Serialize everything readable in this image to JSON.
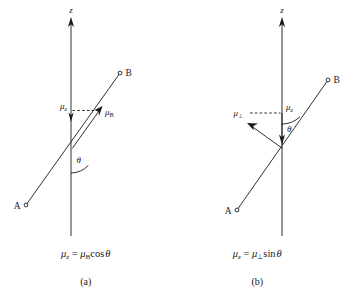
{
  "figure": {
    "background_color": "#ffffff",
    "line_color": "#1a1a1a",
    "panels": [
      {
        "id": "a",
        "caption_letter": "(a)",
        "axis_label": "z",
        "point_a_label": "A",
        "point_b_label": "B",
        "angle_label": "θ",
        "mu_z_label": "μ",
        "mu_z_subscript": "z",
        "mu_vec_label": "μ",
        "mu_vec_subscript": "B",
        "formula": {
          "lhs_symbol": "μ",
          "lhs_subscript": "z",
          "equals": "=",
          "rhs_symbol": "μ",
          "rhs_subscript": "B",
          "rhs_function": "cos",
          "rhs_angle": "θ",
          "plain": "μ_z = μ_B cos θ"
        }
      },
      {
        "id": "b",
        "caption_letter": "(b)",
        "axis_label": "z",
        "point_a_label": "A",
        "point_b_label": "B",
        "angle_label": "θ",
        "mu_z_label": "μ",
        "mu_z_subscript": "z",
        "mu_vec_label": "μ",
        "mu_vec_subscript": "⊥",
        "formula": {
          "lhs_symbol": "μ",
          "lhs_subscript": "z",
          "equals": "=",
          "rhs_symbol": "μ",
          "rhs_subscript": "⊥",
          "rhs_function": "sin",
          "rhs_angle": "θ",
          "plain": "μ_z = μ_⊥ sin θ"
        }
      }
    ]
  }
}
